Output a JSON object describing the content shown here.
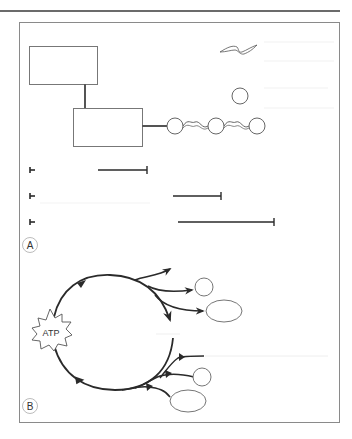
{
  "figure": {
    "panels": [
      {
        "id": "A",
        "label": "A"
      },
      {
        "id": "B",
        "label": "B"
      }
    ],
    "panel_b": {
      "starburst_label": "ATP"
    },
    "timeline_rows": [
      {
        "start_tick": true,
        "bar_start_x": 98,
        "bar_end_x": 147
      },
      {
        "start_tick": true,
        "bar_start_x": 173,
        "bar_end_x": 221
      },
      {
        "start_tick": true,
        "bar_start_x": 178,
        "bar_end_x": 274
      }
    ],
    "colors": {
      "stroke_dark": "#2a2a2a",
      "stroke_frame": "#8a8a8a",
      "stroke_light": "#777777",
      "faint_line": "#ececec"
    }
  }
}
